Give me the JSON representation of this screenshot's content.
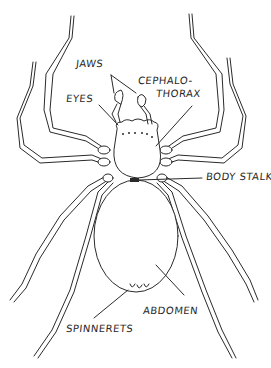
{
  "diagram": {
    "ink_color": "#2a2a2a",
    "background_color": "#ffffff",
    "labels": {
      "jaws": "JAWS",
      "eyes": "EYES",
      "cephalothorax_line1": "CEPHALO-",
      "cephalothorax_line2": "THORAX",
      "body_stalk": "BODY STALK",
      "abdomen": "ABDOMEN",
      "spinnerets": "SPINNERETS"
    }
  }
}
